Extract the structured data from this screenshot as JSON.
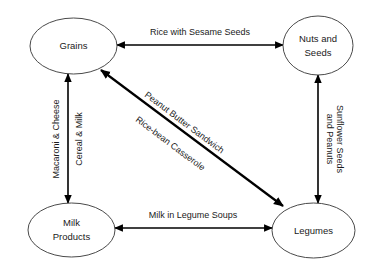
{
  "diagram": {
    "type": "node-edge-graph",
    "background_color": "#ffffff",
    "node_stroke_color": "#4a4a4a",
    "edge_color": "#000000",
    "text_color": "#1a1a1a",
    "nodes": [
      {
        "id": "grains",
        "label_line1": "Grains",
        "label_line2": "",
        "cx": 73.5,
        "cy": 46,
        "rx": 43.5,
        "ry": 28
      },
      {
        "id": "nuts-and-seeds",
        "label_line1": "Nuts and",
        "label_line2": "Seeds",
        "cx": 318,
        "cy": 45.5,
        "rx": 35,
        "ry": 29.5
      },
      {
        "id": "milk-products",
        "label_line1": "Milk",
        "label_line2": "Products",
        "cx": 71.5,
        "cy": 230,
        "rx": 43.5,
        "ry": 27
      },
      {
        "id": "legumes",
        "label_line1": "Legumes",
        "label_line2": "",
        "cx": 313.5,
        "cy": 230.5,
        "rx": 41.5,
        "ry": 27.5
      }
    ],
    "edges": [
      {
        "id": "grains-nuts",
        "from": "grains",
        "to": "nuts-and-seeds",
        "label": "Rice with Sesame Seeds",
        "orientation": "horizontal",
        "x1": 117,
        "y1": 45,
        "x2": 283,
        "y2": 45,
        "label_x": 200,
        "label_y": 33,
        "label_rotation": 0,
        "arrow_start": true,
        "arrow_end": true
      },
      {
        "id": "milk-legumes",
        "from": "milk-products",
        "to": "legumes",
        "label": "Milk in Legume Soups",
        "orientation": "horizontal",
        "x1": 115,
        "y1": 228,
        "x2": 272,
        "y2": 228,
        "label_x": 193,
        "label_y": 216,
        "label_rotation": 0,
        "arrow_start": true,
        "arrow_end": true
      },
      {
        "id": "grains-milk",
        "from": "grains",
        "to": "milk-products",
        "label_left": "Macaroni & Cheese",
        "label_right": "Cereal & Milk",
        "orientation": "vertical",
        "x1": 68,
        "y1": 74,
        "x2": 68,
        "y2": 203,
        "label_left_x": 57,
        "label_left_y": 139,
        "label_right_x": 80,
        "label_right_y": 139,
        "label_rotation": -90,
        "arrow_start": true,
        "arrow_end": true
      },
      {
        "id": "nuts-legumes",
        "from": "nuts-and-seeds",
        "to": "legumes",
        "label_line1": "Sunflower Seeds",
        "label_line2": "and Peanuts",
        "orientation": "vertical",
        "x1": 318,
        "y1": 75,
        "x2": 318,
        "y2": 203,
        "label_line1_x": 339,
        "label_line1_y": 139,
        "label_line2_x": 329,
        "label_line2_y": 139,
        "label_rotation": 90,
        "arrow_start": true,
        "arrow_end": true
      },
      {
        "id": "grains-legumes",
        "from": "grains",
        "to": "legumes",
        "label_above": "Peanut Butter Sandwich",
        "label_below": "Rice-bean Casserole",
        "orientation": "diagonal",
        "x1": 101,
        "y1": 70,
        "x2": 283,
        "y2": 206,
        "label_above_x": 184,
        "label_above_y": 125,
        "label_below_x": 172,
        "label_below_y": 145,
        "label_rotation": 36.8,
        "arrow_start": true,
        "arrow_end": true
      }
    ]
  }
}
